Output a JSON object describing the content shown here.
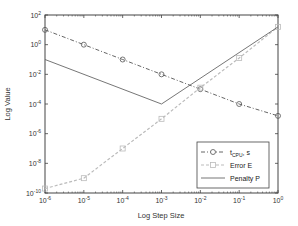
{
  "chart_data": {
    "type": "line",
    "title": "",
    "xlabel": "Log Step Size",
    "ylabel": "Log Value",
    "xscale": "log",
    "yscale": "log",
    "xlim": [
      1e-06,
      1
    ],
    "ylim": [
      1e-10,
      100
    ],
    "grid": false,
    "legend_position": "lower right",
    "x_ticks": [
      "10^-6",
      "10^-5",
      "10^-4",
      "10^-3",
      "10^-2",
      "10^-1",
      "10^0"
    ],
    "y_ticks": [
      "10^-10",
      "10^-8",
      "10^-6",
      "10^-4",
      "10^-2",
      "10^0",
      "10^2"
    ],
    "x": [
      1e-06,
      1e-05,
      0.0001,
      0.001,
      0.01,
      0.1,
      1
    ],
    "series": [
      {
        "name": "t_CPU, s",
        "label_main": "t",
        "label_sub": "CPU",
        "label_suffix": ", s",
        "marker": "circle",
        "line": "dash-dot",
        "color": "#555555",
        "log10_values": [
          1,
          0,
          -1,
          -2,
          -3,
          -4,
          -4.8
        ]
      },
      {
        "name": "Error E",
        "marker": "square",
        "line": "dashed",
        "color": "#bbbbbb",
        "log10_values": [
          -9.7,
          -9,
          -7,
          -5,
          -2.9,
          -0.9,
          1.2
        ]
      },
      {
        "name": "Penalty P",
        "marker": "none",
        "line": "solid",
        "color": "#666666",
        "x_points": [
          1e-06,
          0.001,
          1
        ],
        "log10_values": [
          -1,
          -4,
          1.2
        ]
      }
    ]
  }
}
